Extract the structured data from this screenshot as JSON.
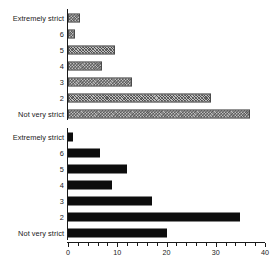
{
  "chart_data": [
    {
      "type": "bar",
      "orientation": "horizontal",
      "panel": "top",
      "title": "",
      "xlabel": "",
      "ylabel": "",
      "xlim": [
        0,
        40
      ],
      "grid": false,
      "legend": "none",
      "bar_style": "hatched",
      "categories": [
        "Extremely strict",
        "6",
        "5",
        "4",
        "3",
        "2",
        "Not very strict"
      ],
      "values": [
        2.5,
        1.5,
        9.5,
        7,
        13,
        29,
        37
      ],
      "xticks": [],
      "xticklabels": []
    },
    {
      "type": "bar",
      "orientation": "horizontal",
      "panel": "bottom",
      "title": "",
      "xlabel": "",
      "ylabel": "",
      "xlim": [
        0,
        40
      ],
      "grid": false,
      "legend": "none",
      "bar_style": "solid-black",
      "categories": [
        "Extremely strict",
        "6",
        "5",
        "4",
        "3",
        "2",
        "Not very strict"
      ],
      "values": [
        1,
        6.5,
        12,
        9,
        17,
        35,
        20
      ],
      "xticks": [
        0,
        10,
        20,
        30,
        40
      ],
      "xticklabels": [
        "0",
        "10",
        "20",
        "30",
        "40"
      ],
      "minor_tick_step": 2
    }
  ],
  "top": {
    "rows": [
      {
        "label": "Extremely strict",
        "value": 2.5
      },
      {
        "label": "6",
        "value": 1.5
      },
      {
        "label": "5",
        "value": 9.5
      },
      {
        "label": "4",
        "value": 7
      },
      {
        "label": "3",
        "value": 13
      },
      {
        "label": "2",
        "value": 29
      },
      {
        "label": "Not very strict",
        "value": 37
      }
    ]
  },
  "bottom": {
    "rows": [
      {
        "label": "Extremely strict",
        "value": 1
      },
      {
        "label": "6",
        "value": 6.5
      },
      {
        "label": "5",
        "value": 12
      },
      {
        "label": "4",
        "value": 9
      },
      {
        "label": "3",
        "value": 17
      },
      {
        "label": "2",
        "value": 35
      },
      {
        "label": "Not very strict",
        "value": 20
      }
    ],
    "axis": {
      "labels": [
        "0",
        "10",
        "20",
        "30",
        "40"
      ],
      "values": [
        0,
        10,
        20,
        30,
        40
      ]
    }
  },
  "colors": {
    "ink": "#1a1a1a",
    "bar_solid": "#0d0d0d",
    "bar_hatch_fill": "#bfbfbf",
    "bar_hatch_line": "#3c3c3c",
    "background": "#ffffff"
  }
}
